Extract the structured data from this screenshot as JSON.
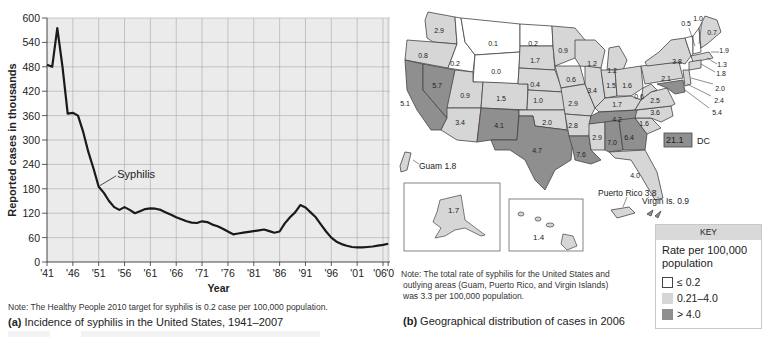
{
  "chart_data": [
    {
      "type": "line",
      "title": "Incidence of syphilis in the United States, 1941–2007",
      "panel_label": "(a)",
      "xlabel": "Year",
      "ylabel": "Reported cases in thousands",
      "ylim": [
        0,
        600
      ],
      "yticks": [
        0,
        60,
        120,
        180,
        240,
        300,
        360,
        420,
        480,
        540,
        600
      ],
      "xtick_labels": [
        "'41",
        "'46",
        "'51",
        "'56",
        "'61",
        "'66",
        "'71",
        "'76",
        "'81",
        "'86",
        "'91",
        "'96",
        "'01",
        "'06",
        "'07"
      ],
      "grid": true,
      "series": [
        {
          "name": "Syphilis",
          "x": [
            1941,
            1942,
            1943,
            1944,
            1945,
            1946,
            1947,
            1948,
            1949,
            1950,
            1951,
            1952,
            1953,
            1954,
            1955,
            1956,
            1957,
            1958,
            1959,
            1960,
            1961,
            1962,
            1963,
            1964,
            1965,
            1966,
            1967,
            1968,
            1969,
            1970,
            1971,
            1972,
            1973,
            1974,
            1975,
            1976,
            1977,
            1978,
            1979,
            1980,
            1981,
            1982,
            1983,
            1984,
            1985,
            1986,
            1987,
            1988,
            1989,
            1990,
            1991,
            1992,
            1993,
            1994,
            1995,
            1996,
            1997,
            1998,
            1999,
            2000,
            2001,
            2002,
            2003,
            2004,
            2005,
            2006,
            2007
          ],
          "values": [
            485,
            480,
            575,
            480,
            365,
            367,
            360,
            320,
            270,
            230,
            185,
            170,
            150,
            135,
            128,
            135,
            128,
            120,
            125,
            130,
            132,
            131,
            128,
            122,
            116,
            110,
            105,
            100,
            97,
            96,
            100,
            98,
            92,
            88,
            82,
            75,
            68,
            70,
            72,
            74,
            76,
            78,
            80,
            76,
            72,
            75,
            95,
            110,
            122,
            140,
            134,
            122,
            110,
            92,
            75,
            60,
            50,
            44,
            40,
            37,
            36,
            36,
            37,
            38,
            40,
            42,
            45
          ]
        }
      ],
      "annotations": [
        {
          "text": "Syphilis",
          "x": 1951,
          "y": 185
        }
      ],
      "note": "Note: The Healthy People 2010 target for syphilis is 0.2 case per 100,000 population."
    },
    {
      "type": "choropleth",
      "title": "Geographical distribution of cases in 2006",
      "panel_label": "(b)",
      "legend": {
        "header": "KEY",
        "title": "Rate per 100,000 population",
        "bins": [
          {
            "label": "≤ 0.2",
            "color": "#ffffff"
          },
          {
            "label": "0.21–4.0",
            "color": "#d6d6d6"
          },
          {
            "label": "> 4.0",
            "color": "#8f8f8f"
          }
        ]
      },
      "regions": {
        "WA": 2.9,
        "OR": 0.8,
        "CA": 5.1,
        "NV": 5.7,
        "ID": 0.2,
        "MT": 0.1,
        "WY": 0.0,
        "UT": 0.9,
        "AZ": 3.4,
        "CO": 1.5,
        "NM": 4.1,
        "ND": 0.2,
        "SD": 1.7,
        "NE": 0.4,
        "KS": 1.0,
        "OK": 2.0,
        "TX": 4.7,
        "MN": 0.9,
        "IA": 0.6,
        "MO": 2.9,
        "AR": 2.8,
        "LA": 7.6,
        "WI": 1.2,
        "IL": 3.4,
        "MI": 1.2,
        "IN": 1.5,
        "OH": 1.6,
        "KY": 1.7,
        "TN": 4.2,
        "MS": 2.9,
        "AL": 7.0,
        "GA": 6.4,
        "FL": 4.0,
        "SC": 1.6,
        "NC": 3.6,
        "VA": 2.5,
        "WV": 0.6,
        "PA": 2.1,
        "NY": 3.8,
        "VT": 0.5,
        "NH": 1.0,
        "ME": 0.7,
        "MA": 1.9,
        "RI": 1.3,
        "CT": 1.8,
        "NJ": 2.0,
        "DE": 2.4,
        "MD": 5.4,
        "AK": 1.7,
        "HI": 1.4,
        "DC": 21.1,
        "Guam": 1.8,
        "Puerto Rico": 3.8,
        "Virgin Is.": 0.9
      },
      "note": "Note: The total rate of syphilis for the United States and outlying areas (Guam, Puerto Rico, and Virgin Islands) was 3.3 per 100,000 population."
    }
  ],
  "panel_a": {
    "ylabel": "Reported cases in thousands",
    "xlabel": "Year",
    "series_label": "Syphilis",
    "note": "Note: The Healthy People 2010 target for syphilis is 0.2 case per 100,000 population.",
    "caption_label": "(a)",
    "caption_text": " Incidence of syphilis in the United States, 1941–2007"
  },
  "panel_b": {
    "dc_value": "21.1",
    "dc_label": "DC",
    "guam_label": "Guam 1.8",
    "puerto_rico_label": "Puerto Rico 3.8",
    "virgin_islands_label": "Virgin Is. 0.9",
    "alaska_value": "1.7",
    "hawaii_value": "1.4",
    "note_line1": "Note: The total rate of syphilis for the United States and",
    "note_line2": "outlying areas (Guam, Puerto Rico, and Virgin Islands)",
    "note_line3": "was 3.3 per 100,000 population.",
    "caption_label": "(b)",
    "caption_text": " Geographical distribution of cases in 2006",
    "key": {
      "header": "KEY",
      "title_line1": "Rate per 100,000",
      "title_line2": "population",
      "bin1": "≤ 0.2",
      "bin2": "0.21–4.0",
      "bin3": "> 4.0"
    }
  },
  "colors": {
    "plot_bg": "#ebebeb",
    "grid": "#a8a8a8",
    "line": "#1a1a1a",
    "low": "#ffffff",
    "mid": "#d6d6d6",
    "high": "#8f8f8f",
    "state_border": "#444444"
  }
}
